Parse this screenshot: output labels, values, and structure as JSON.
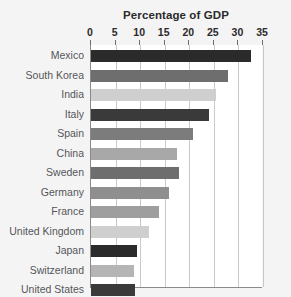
{
  "chart_data": {
    "type": "bar",
    "orientation": "horizontal",
    "title": "Percentage of GDP",
    "xlabel": "",
    "ylabel": "",
    "xlim": [
      0,
      35
    ],
    "xticks": [
      0,
      5,
      10,
      15,
      20,
      25,
      30,
      35
    ],
    "grid": true,
    "legend": "none",
    "categories": [
      "Mexico",
      "South Korea",
      "India",
      "Italy",
      "Spain",
      "China",
      "Sweden",
      "Germany",
      "France",
      "United Kingdom",
      "Japan",
      "Switzerland",
      "United States"
    ],
    "values": [
      32.6,
      27.9,
      25.5,
      24.0,
      20.8,
      17.5,
      17.9,
      15.9,
      13.8,
      11.8,
      9.4,
      8.8,
      9.0
    ],
    "bar_colors": [
      "#2b2b2b",
      "#6e6e6e",
      "#cfcfcf",
      "#3a3a3a",
      "#7c7c7c",
      "#a8a8a8",
      "#6e6e6e",
      "#8f8f8f",
      "#9e9e9e",
      "#cfcfcf",
      "#2b2b2b",
      "#b5b5b5",
      "#3a3a3a"
    ]
  },
  "colors": {
    "background": "#f4f4f4",
    "plot_background": "#ffffff",
    "axis_line": "#8a8a8a",
    "gridline": "#c9c9c9",
    "title_text": "#2b2b2b",
    "label_text": "#55565a"
  }
}
